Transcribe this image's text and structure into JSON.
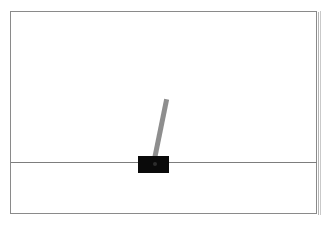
{
  "scene": {
    "name": "cartpole-viewport",
    "description": "Inverted pendulum (cart-pole) simulation viewport",
    "background_color": "#ffffff",
    "frame": {
      "name": "viewport-frame",
      "border_color": "#8a8a8a",
      "border_width_px": 1,
      "x": 10,
      "y": 11,
      "width": 307,
      "height": 203
    },
    "track": {
      "name": "ground-track-line",
      "color": "#7d7d7d",
      "y": 162,
      "x_start": 11,
      "x_end": 317,
      "thickness_px": 1
    },
    "cart": {
      "name": "cart-body",
      "color": "#0a0a0a",
      "x": 138,
      "y": 156,
      "width": 31,
      "height": 17,
      "center_x": 153.5,
      "position_normalized": 0.465
    },
    "pole": {
      "name": "balance-pole",
      "color": "#8e8e8e",
      "pivot_x": 153.5,
      "pivot_y": 164,
      "length_px": 66,
      "thickness_px": 5,
      "angle_degrees": 11.5,
      "tip_x": 166.5,
      "tip_y": 99
    },
    "pivot": {
      "name": "pole-pivot-joint",
      "color": "#4a4a4a",
      "x": 153,
      "y": 162
    }
  },
  "chart_data": {
    "type": "scatter",
    "title": "",
    "xlabel": "",
    "ylabel": "",
    "annotations": [
      "cart at x ≈ 0.465 of track width",
      "pole tilted 11.5° clockwise from vertical"
    ],
    "series": [
      {
        "name": "cart-position",
        "x": [
          153.5
        ],
        "values": [
          162
        ]
      },
      {
        "name": "pole-tip",
        "x": [
          166.5
        ],
        "values": [
          99
        ]
      }
    ],
    "xlim": [
      11,
      317
    ],
    "ylim": [
      11,
      214
    ],
    "grid": false,
    "legend": "none"
  }
}
